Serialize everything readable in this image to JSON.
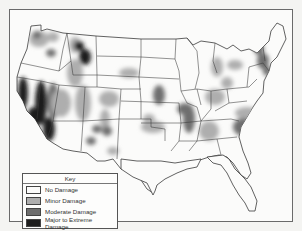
{
  "map": {
    "title": "Drought / Damage Map of the Contiguous United States",
    "colors": {
      "none": "#fbfbfa",
      "minor": "#aeaeae",
      "moderate": "#6e6e6e",
      "extreme": "#1e1e1e",
      "border": "#3a3a3a"
    }
  },
  "legend": {
    "title": "Key",
    "items": [
      {
        "label": "No Damage",
        "level": "none"
      },
      {
        "label": "Minor Damage",
        "level": "minor"
      },
      {
        "label": "Moderate Damage",
        "level": "moderate"
      },
      {
        "label": "Major to Extreme Damage",
        "level": "extreme"
      }
    ]
  },
  "regions": [
    {
      "name": "pacific-northwest",
      "level": "minor"
    },
    {
      "name": "washington-spot",
      "level": "moderate"
    },
    {
      "name": "montana-west",
      "level": "extreme"
    },
    {
      "name": "california-coast",
      "level": "extreme"
    },
    {
      "name": "sierra-nevada",
      "level": "extreme"
    },
    {
      "name": "nevada-west",
      "level": "moderate"
    },
    {
      "name": "idaho-utah",
      "level": "minor"
    },
    {
      "name": "colorado",
      "level": "minor"
    },
    {
      "name": "arizona-south",
      "level": "moderate"
    },
    {
      "name": "new-mexico",
      "level": "moderate"
    },
    {
      "name": "nebraska",
      "level": "minor"
    },
    {
      "name": "kansas-missouri",
      "level": "moderate"
    },
    {
      "name": "oklahoma",
      "level": "minor"
    },
    {
      "name": "mississippi-valley",
      "level": "moderate"
    },
    {
      "name": "ohio-valley",
      "level": "minor"
    },
    {
      "name": "great-lakes",
      "level": "minor"
    },
    {
      "name": "new-england",
      "level": "moderate"
    },
    {
      "name": "southeast",
      "level": "moderate"
    },
    {
      "name": "alabama-georgia",
      "level": "minor"
    },
    {
      "name": "texas-west",
      "level": "minor"
    }
  ]
}
